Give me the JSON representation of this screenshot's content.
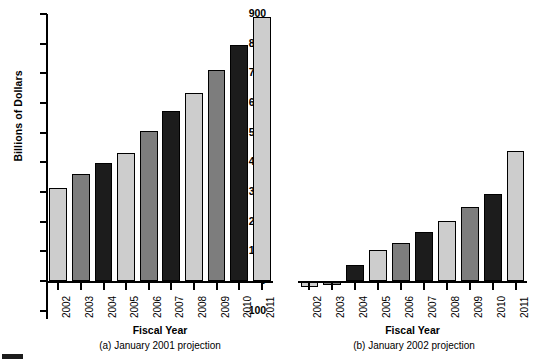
{
  "figure": {
    "partial_caption_marker": "black-square-marker",
    "partial_caption_text": ""
  },
  "axis": {
    "y_title": "Billions of Dollars",
    "y_ticks": [
      "900",
      "800",
      "700",
      "600",
      "500",
      "400",
      "300",
      "200",
      "100",
      "0",
      "-100"
    ],
    "y_min": -100,
    "y_max": 900,
    "x_title_a": "Fiscal Year",
    "x_title_b": "Fiscal Year"
  },
  "panel_a": {
    "caption": "(a) January 2001 projection"
  },
  "panel_b": {
    "caption": "(b) January 2002 projection"
  },
  "colors": {
    "light": "#cdcdcd",
    "mid": "#7d7d7d",
    "dark": "#1c1c1c",
    "outline": "#000000",
    "background": "#ffffff"
  },
  "chart_data": [
    {
      "type": "bar",
      "title": "(a) January 2001 projection",
      "xlabel": "Fiscal Year",
      "ylabel": "Billions of Dollars",
      "ylim": [
        -100,
        900
      ],
      "yticks": [
        -100,
        0,
        100,
        200,
        300,
        400,
        500,
        600,
        700,
        800,
        900
      ],
      "grid": false,
      "legend": "none",
      "categories": [
        "2002",
        "2003",
        "2004",
        "2005",
        "2006",
        "2007",
        "2008",
        "2009",
        "2010",
        "2011"
      ],
      "values": [
        313,
        359,
        397,
        433,
        505,
        573,
        635,
        710,
        796,
        889
      ],
      "bar_colors": [
        "light",
        "mid",
        "dark",
        "light",
        "mid",
        "dark",
        "light",
        "mid",
        "dark",
        "light"
      ]
    },
    {
      "type": "bar",
      "title": "(b) January 2002 projection",
      "xlabel": "Fiscal Year",
      "ylabel": "Billions of Dollars",
      "ylim": [
        -100,
        900
      ],
      "yticks": [
        -100,
        0,
        100,
        200,
        300,
        400,
        500,
        600,
        700,
        800,
        900
      ],
      "grid": false,
      "legend": "none",
      "categories": [
        "2002",
        "2003",
        "2004",
        "2005",
        "2006",
        "2007",
        "2008",
        "2009",
        "2010",
        "2011"
      ],
      "values": [
        -21,
        -14,
        54,
        103,
        128,
        166,
        202,
        250,
        294,
        439
      ],
      "bar_colors": [
        "light",
        "mid",
        "dark",
        "light",
        "mid",
        "dark",
        "light",
        "mid",
        "dark",
        "light"
      ]
    }
  ]
}
